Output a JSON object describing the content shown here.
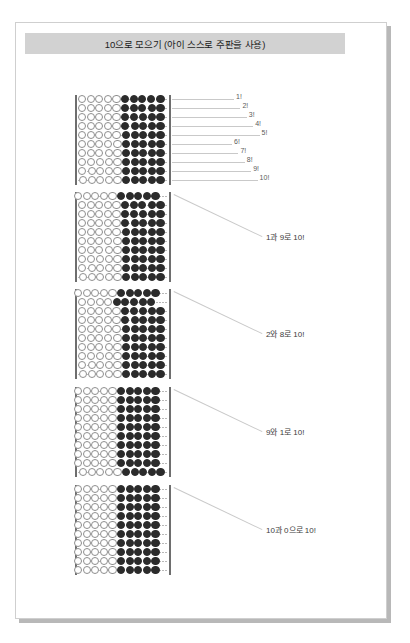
{
  "header": {
    "title": "10으로 모으기 (아이 스스로 주판을 사용)"
  },
  "abacus": {
    "columns": 10,
    "rows_per_block": 10,
    "bead_states": {
      "dark": "filled-bead",
      "light": "empty-bead"
    }
  },
  "blocks": [
    {
      "id": "block-1",
      "label": "",
      "tick_labels": [
        "1!",
        "2!",
        "3!",
        "4!",
        "5!",
        "6!",
        "7!",
        "8!",
        "9!",
        "10!"
      ],
      "rows": [
        {
          "left_light": 5,
          "left_dark": 4,
          "right_light": 0,
          "right_dark": 1
        },
        {
          "left_light": 5,
          "left_dark": 3,
          "right_light": 0,
          "right_dark": 2
        },
        {
          "left_light": 5,
          "left_dark": 2,
          "right_light": 0,
          "right_dark": 3
        },
        {
          "left_light": 5,
          "left_dark": 1,
          "right_light": 0,
          "right_dark": 4
        },
        {
          "left_light": 5,
          "left_dark": 0,
          "right_light": 0,
          "right_dark": 5
        },
        {
          "left_light": 4,
          "left_dark": 0,
          "right_light": 1,
          "right_dark": 5
        },
        {
          "left_light": 3,
          "left_dark": 0,
          "right_light": 2,
          "right_dark": 5
        },
        {
          "left_light": 2,
          "left_dark": 0,
          "right_light": 3,
          "right_dark": 5
        },
        {
          "left_light": 1,
          "left_dark": 0,
          "right_light": 4,
          "right_dark": 5
        },
        {
          "left_light": 0,
          "left_dark": 0,
          "right_light": 5,
          "right_dark": 5
        }
      ]
    },
    {
      "id": "block-2",
      "label": "1과 9로 10!",
      "tick_labels": [],
      "rows": [
        {
          "left_light": 0,
          "left_dark": 0,
          "right_light": 5,
          "right_dark": 5,
          "shifted": true
        },
        {
          "left_light": 5,
          "left_dark": 3,
          "right_light": 0,
          "right_dark": 2
        },
        {
          "left_light": 5,
          "left_dark": 2,
          "right_light": 0,
          "right_dark": 3
        },
        {
          "left_light": 5,
          "left_dark": 1,
          "right_light": 0,
          "right_dark": 4
        },
        {
          "left_light": 5,
          "left_dark": 0,
          "right_light": 0,
          "right_dark": 5
        },
        {
          "left_light": 4,
          "left_dark": 0,
          "right_light": 1,
          "right_dark": 5
        },
        {
          "left_light": 3,
          "left_dark": 0,
          "right_light": 2,
          "right_dark": 5
        },
        {
          "left_light": 2,
          "left_dark": 0,
          "right_light": 3,
          "right_dark": 5
        },
        {
          "left_light": 1,
          "left_dark": 0,
          "right_light": 4,
          "right_dark": 5
        },
        {
          "left_light": 0,
          "left_dark": 0,
          "right_light": 5,
          "right_dark": 5
        }
      ]
    },
    {
      "id": "block-3",
      "label": "2와 8로 10!",
      "tick_labels": [],
      "rows": [
        {
          "left_light": 0,
          "left_dark": 0,
          "right_light": 5,
          "right_dark": 5,
          "shifted": true
        },
        {
          "left_light": 0,
          "left_dark": 0,
          "right_light": 4,
          "right_dark": 5,
          "shifted": true
        },
        {
          "left_light": 5,
          "left_dark": 2,
          "right_light": 0,
          "right_dark": 3
        },
        {
          "left_light": 5,
          "left_dark": 1,
          "right_light": 0,
          "right_dark": 4
        },
        {
          "left_light": 5,
          "left_dark": 0,
          "right_light": 0,
          "right_dark": 5
        },
        {
          "left_light": 4,
          "left_dark": 0,
          "right_light": 1,
          "right_dark": 5
        },
        {
          "left_light": 3,
          "left_dark": 0,
          "right_light": 2,
          "right_dark": 5
        },
        {
          "left_light": 2,
          "left_dark": 0,
          "right_light": 3,
          "right_dark": 5
        },
        {
          "left_light": 1,
          "left_dark": 0,
          "right_light": 4,
          "right_dark": 5
        },
        {
          "left_light": 0,
          "left_dark": 0,
          "right_light": 5,
          "right_dark": 5
        }
      ]
    },
    {
      "id": "block-4",
      "label": "9와 1로 10!",
      "tick_labels": [],
      "rows": [
        {
          "left_light": 0,
          "left_dark": 0,
          "right_light": 5,
          "right_dark": 5,
          "shifted": true
        },
        {
          "left_light": 0,
          "left_dark": 0,
          "right_light": 5,
          "right_dark": 5,
          "shifted": true
        },
        {
          "left_light": 0,
          "left_dark": 0,
          "right_light": 5,
          "right_dark": 5,
          "shifted": true
        },
        {
          "left_light": 0,
          "left_dark": 0,
          "right_light": 5,
          "right_dark": 5,
          "shifted": true
        },
        {
          "left_light": 0,
          "left_dark": 0,
          "right_light": 5,
          "right_dark": 5,
          "shifted": true
        },
        {
          "left_light": 0,
          "left_dark": 0,
          "right_light": 5,
          "right_dark": 5,
          "shifted": true
        },
        {
          "left_light": 0,
          "left_dark": 0,
          "right_light": 5,
          "right_dark": 5,
          "shifted": true
        },
        {
          "left_light": 0,
          "left_dark": 0,
          "right_light": 5,
          "right_dark": 5,
          "shifted": true
        },
        {
          "left_light": 0,
          "left_dark": 0,
          "right_light": 5,
          "right_dark": 5,
          "shifted": true
        },
        {
          "left_light": 0,
          "left_dark": 0,
          "right_light": 5,
          "right_dark": 5
        }
      ]
    },
    {
      "id": "block-5",
      "label": "10과 0으로 10!",
      "tick_labels": [],
      "rows": [
        {
          "left_light": 0,
          "left_dark": 0,
          "right_light": 5,
          "right_dark": 5,
          "shifted": true
        },
        {
          "left_light": 0,
          "left_dark": 0,
          "right_light": 5,
          "right_dark": 5,
          "shifted": true
        },
        {
          "left_light": 0,
          "left_dark": 0,
          "right_light": 5,
          "right_dark": 5,
          "shifted": true
        },
        {
          "left_light": 0,
          "left_dark": 0,
          "right_light": 5,
          "right_dark": 5,
          "shifted": true
        },
        {
          "left_light": 0,
          "left_dark": 0,
          "right_light": 5,
          "right_dark": 5,
          "shifted": true
        },
        {
          "left_light": 0,
          "left_dark": 0,
          "right_light": 5,
          "right_dark": 5,
          "shifted": true
        },
        {
          "left_light": 0,
          "left_dark": 0,
          "right_light": 5,
          "right_dark": 5,
          "shifted": true
        },
        {
          "left_light": 0,
          "left_dark": 0,
          "right_light": 5,
          "right_dark": 5,
          "shifted": true
        },
        {
          "left_light": 0,
          "left_dark": 0,
          "right_light": 5,
          "right_dark": 5,
          "shifted": true
        },
        {
          "left_light": 0,
          "left_dark": 0,
          "right_light": 5,
          "right_dark": 5,
          "shifted": true
        }
      ]
    }
  ],
  "colors": {
    "title_bg": "#d2d2d2",
    "bead_dark": "#2b2b2b",
    "bead_light_border": "#8e8e8e",
    "frame": "#6e6e6e",
    "leader": "#c9c9c9",
    "page_border": "#cfcfcf"
  }
}
